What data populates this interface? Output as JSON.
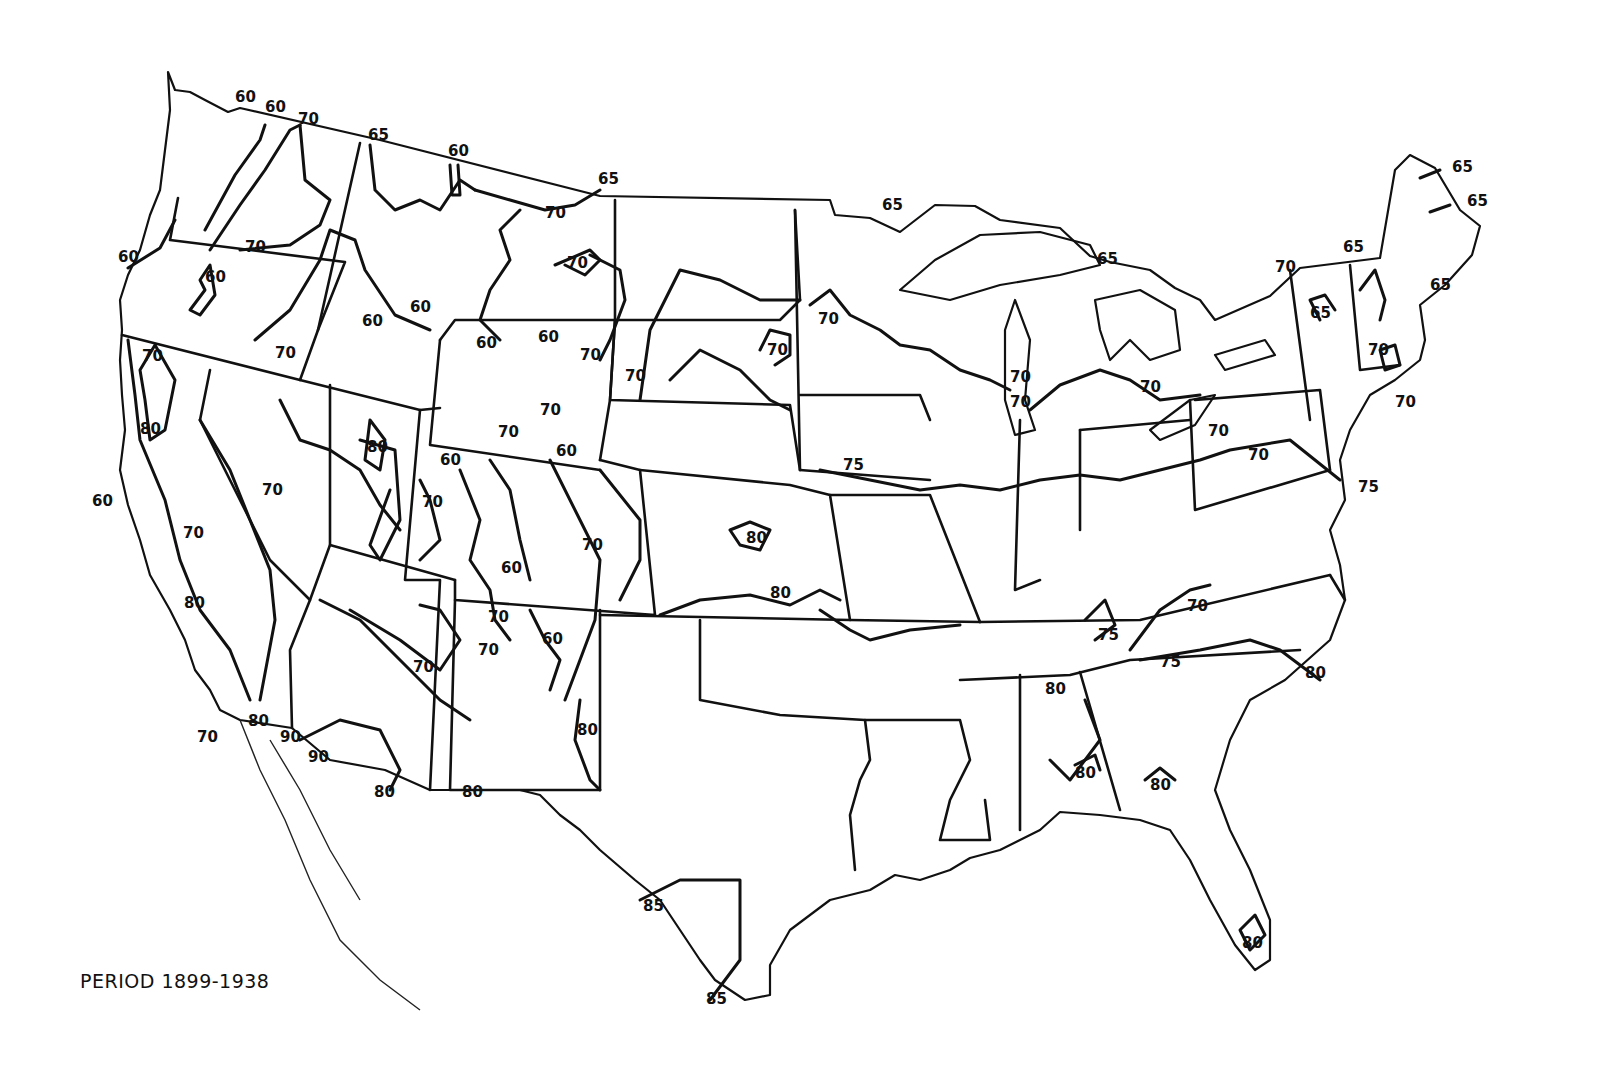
{
  "map": {
    "title": "",
    "region": "Contiguous United States",
    "period_caption": "PERIOD 1899-1938",
    "line_color": "#111111",
    "background_color": "#ffffff",
    "isoline_values_present": [
      60,
      65,
      70,
      75,
      80,
      85,
      90
    ]
  },
  "labels": [
    {
      "id": "wa-n-1",
      "text": "60",
      "x": 235,
      "y": 102
    },
    {
      "id": "wa-n-2",
      "text": "60",
      "x": 265,
      "y": 112
    },
    {
      "id": "wa-n-3",
      "text": "70",
      "x": 298,
      "y": 124
    },
    {
      "id": "id-n",
      "text": "65",
      "x": 368,
      "y": 140
    },
    {
      "id": "mt-nw",
      "text": "60",
      "x": 448,
      "y": 156
    },
    {
      "id": "mt-ne",
      "text": "65",
      "x": 605,
      "y": 184
    },
    {
      "id": "mt-c",
      "text": "70",
      "x": 555,
      "y": 218
    },
    {
      "id": "mt-e",
      "text": "70",
      "x": 577,
      "y": 268
    },
    {
      "id": "wa-s",
      "text": "70",
      "x": 252,
      "y": 252
    },
    {
      "id": "or-coast",
      "text": "60",
      "x": 128,
      "y": 262
    },
    {
      "id": "or-c",
      "text": "60",
      "x": 218,
      "y": 282
    },
    {
      "id": "id-c",
      "text": "60",
      "x": 370,
      "y": 326
    },
    {
      "id": "id-e",
      "text": "60",
      "x": 420,
      "y": 312
    },
    {
      "id": "or-se",
      "text": "70",
      "x": 285,
      "y": 358
    },
    {
      "id": "mt-s",
      "text": "60",
      "x": 546,
      "y": 342
    },
    {
      "id": "wy-nw",
      "text": "60",
      "x": 486,
      "y": 348
    },
    {
      "id": "wy-ne",
      "text": "70",
      "x": 588,
      "y": 360
    },
    {
      "id": "sd-w",
      "text": "70",
      "x": 635,
      "y": 381
    },
    {
      "id": "nd-e",
      "text": "70",
      "x": 777,
      "y": 355
    },
    {
      "id": "mn-w",
      "text": "70",
      "x": 828,
      "y": 324
    },
    {
      "id": "mn-ne",
      "text": "65",
      "x": 892,
      "y": 210
    },
    {
      "id": "mi-n",
      "text": "65",
      "x": 1107,
      "y": 264
    },
    {
      "id": "ca-n",
      "text": "70",
      "x": 152,
      "y": 361
    },
    {
      "id": "wy-c",
      "text": "70",
      "x": 550,
      "y": 415
    },
    {
      "id": "wy-s",
      "text": "70",
      "x": 508,
      "y": 437
    },
    {
      "id": "co-n",
      "text": "60",
      "x": 566,
      "y": 456
    },
    {
      "id": "ut-nw",
      "text": "60",
      "x": 450,
      "y": 465
    },
    {
      "id": "wi-e-1",
      "text": "70",
      "x": 1020,
      "y": 382
    },
    {
      "id": "wi-e-2",
      "text": "70",
      "x": 1020,
      "y": 407
    },
    {
      "id": "oh-n",
      "text": "70",
      "x": 1150,
      "y": 392
    },
    {
      "id": "ca-nc",
      "text": "80",
      "x": 150,
      "y": 434
    },
    {
      "id": "ut-w",
      "text": "80",
      "x": 377,
      "y": 452
    },
    {
      "id": "nv-c",
      "text": "70",
      "x": 272,
      "y": 495
    },
    {
      "id": "ut-c",
      "text": "70",
      "x": 432,
      "y": 507
    },
    {
      "id": "ia-s",
      "text": "75",
      "x": 853,
      "y": 470
    },
    {
      "id": "ca-coast",
      "text": "60",
      "x": 102,
      "y": 506
    },
    {
      "id": "pa-w",
      "text": "70",
      "x": 1218,
      "y": 436
    },
    {
      "id": "pa-c",
      "text": "70",
      "x": 1258,
      "y": 460
    },
    {
      "id": "nj",
      "text": "75",
      "x": 1368,
      "y": 492
    },
    {
      "id": "ca-c",
      "text": "70",
      "x": 193,
      "y": 538
    },
    {
      "id": "co-c",
      "text": "70",
      "x": 592,
      "y": 550
    },
    {
      "id": "ks-c",
      "text": "80",
      "x": 756,
      "y": 543
    },
    {
      "id": "co-sw",
      "text": "60",
      "x": 511,
      "y": 573
    },
    {
      "id": "ks-s",
      "text": "80",
      "x": 780,
      "y": 598
    },
    {
      "id": "ca-s",
      "text": "80",
      "x": 194,
      "y": 608
    },
    {
      "id": "nm-nw",
      "text": "70",
      "x": 498,
      "y": 622
    },
    {
      "id": "nm-n",
      "text": "60",
      "x": 552,
      "y": 644
    },
    {
      "id": "nm-w",
      "text": "70",
      "x": 488,
      "y": 655
    },
    {
      "id": "az-c",
      "text": "70",
      "x": 423,
      "y": 672
    },
    {
      "id": "tn-c",
      "text": "75",
      "x": 1108,
      "y": 640
    },
    {
      "id": "va-sw",
      "text": "70",
      "x": 1197,
      "y": 611
    },
    {
      "id": "nc-w",
      "text": "75",
      "x": 1170,
      "y": 667
    },
    {
      "id": "nc-coast",
      "text": "80",
      "x": 1315,
      "y": 678
    },
    {
      "id": "ms-n",
      "text": "80",
      "x": 1055,
      "y": 694
    },
    {
      "id": "nm-se",
      "text": "80",
      "x": 587,
      "y": 735
    },
    {
      "id": "mx-1",
      "text": "70",
      "x": 207,
      "y": 742
    },
    {
      "id": "mx-2",
      "text": "80",
      "x": 258,
      "y": 726
    },
    {
      "id": "mx-3",
      "text": "90",
      "x": 290,
      "y": 742
    },
    {
      "id": "az-sw",
      "text": "90",
      "x": 318,
      "y": 762
    },
    {
      "id": "al-s",
      "text": "80",
      "x": 1085,
      "y": 778
    },
    {
      "id": "ga-s",
      "text": "80",
      "x": 1160,
      "y": 790
    },
    {
      "id": "az-s",
      "text": "80",
      "x": 384,
      "y": 797
    },
    {
      "id": "nm-s",
      "text": "80",
      "x": 472,
      "y": 797
    },
    {
      "id": "tx-s",
      "text": "85",
      "x": 653,
      "y": 911
    },
    {
      "id": "fl-s",
      "text": "80",
      "x": 1252,
      "y": 948
    },
    {
      "id": "tx-tip",
      "text": "85",
      "x": 716,
      "y": 1004
    },
    {
      "id": "ny-n",
      "text": "70",
      "x": 1285,
      "y": 272
    },
    {
      "id": "vt-n",
      "text": "65",
      "x": 1353,
      "y": 252
    },
    {
      "id": "ny-c",
      "text": "65",
      "x": 1318,
      "y": 318
    },
    {
      "id": "me-1",
      "text": "65",
      "x": 1462,
      "y": 172
    },
    {
      "id": "me-2",
      "text": "65",
      "x": 1477,
      "y": 206
    },
    {
      "id": "me-3",
      "text": "65",
      "x": 1440,
      "y": 290
    },
    {
      "id": "ma",
      "text": "70",
      "x": 1378,
      "y": 355
    },
    {
      "id": "ri",
      "text": "70",
      "x": 1405,
      "y": 407
    }
  ]
}
